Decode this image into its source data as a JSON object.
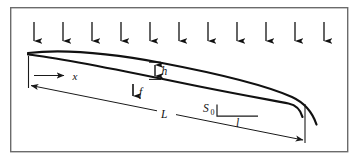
{
  "figure": {
    "frame": {
      "name": "figure-border",
      "x": 10,
      "y": 7,
      "width": 338,
      "height": 145,
      "stroke": "#6b6b6b",
      "stroke_width": 1.4,
      "fill": "#ffffff"
    },
    "colors": {
      "curve": "#111111",
      "dimension": "#1a1a1a",
      "arrow": "#111111",
      "border": "#6b6b6b",
      "background": "#ffffff"
    },
    "rainfall": {
      "name": "rainfall-arrows",
      "count": 11,
      "label": "rainfall",
      "x_positions": [
        34,
        63,
        92,
        121,
        150,
        179,
        208,
        237,
        266,
        295,
        324
      ],
      "y_top": 22,
      "y_bottom": 45,
      "stroke_width": 1.3
    },
    "surfaces": {
      "water_surface": {
        "name": "water-surface-curve",
        "path": "M 28,53 C 60,49.5 110,53 160,62 C 210,71 265,84 292,96 C 305,102 312,112 316,124",
        "stroke_width": 2.2
      },
      "bed_surface": {
        "name": "bed-surface-curve",
        "path": "M 28,54.5 C 70,59 140,74 200,86 C 240,94 272,100 288,103 C 295,104.5 300,109 302,116",
        "stroke_width": 2.2
      }
    },
    "dimensions": {
      "x": {
        "label": "x",
        "name": "dimension-x",
        "line": {
          "x1": 35,
          "y1": 76,
          "x2": 66,
          "y2": 76
        },
        "label_x": 74,
        "label_y": 79
      },
      "h": {
        "label": "h",
        "name": "dimension-h",
        "line": {
          "x1": 155,
          "y1": 62,
          "x2": 155,
          "y2": 79
        },
        "label_x": 162,
        "label_y": 74
      },
      "f": {
        "label": "f",
        "name": "dimension-f",
        "line": {
          "x1": 133,
          "y1": 84,
          "x2": 133,
          "y2": 98
        },
        "label_x": 140,
        "label_y": 96
      },
      "L": {
        "label": "L",
        "name": "dimension-L",
        "line_left": {
          "x1": 29,
          "y1": 85,
          "x2": 158,
          "y2": 111
        },
        "line_right": {
          "x1": 175,
          "y1": 114,
          "x2": 305,
          "y2": 140
        },
        "label_x": 166,
        "label_y": 117,
        "tick_left": {
          "x1": 28,
          "y1": 57,
          "x2": 28,
          "y2": 88
        },
        "tick_right": {
          "x1": 305,
          "y1": 105,
          "x2": 305,
          "y2": 143
        }
      },
      "S0": {
        "label": "S",
        "subscript": "0",
        "name": "dimension-slope-s0",
        "label_x": 206,
        "label_y": 112,
        "sub_x": 214,
        "sub_y": 115,
        "bracket_vertical": {
          "x1": 219,
          "y1": 105,
          "x2": 219,
          "y2": 116
        },
        "bracket_horizontal": {
          "x1": 219,
          "y1": 116,
          "x2": 259,
          "y2": 116
        }
      },
      "l": {
        "label": "l",
        "name": "dimension-l",
        "label_x": 238,
        "label_y": 127
      }
    }
  }
}
